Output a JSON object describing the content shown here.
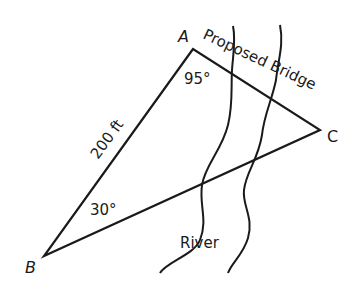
{
  "diagram": {
    "vertices": [
      {
        "id": "A",
        "label": "A",
        "x": 193,
        "y": 49
      },
      {
        "id": "B",
        "label": "B",
        "x": 44,
        "y": 256
      },
      {
        "id": "C",
        "label": "C",
        "x": 320,
        "y": 130
      }
    ],
    "side_AB_label": "200 ft",
    "side_AC_label": "Proposed Bridge",
    "angle_A_label": "95°",
    "angle_B_label": "30°",
    "river_label": "River",
    "colors": {
      "stroke": "#1a1a1a",
      "background": "#ffffff"
    }
  }
}
